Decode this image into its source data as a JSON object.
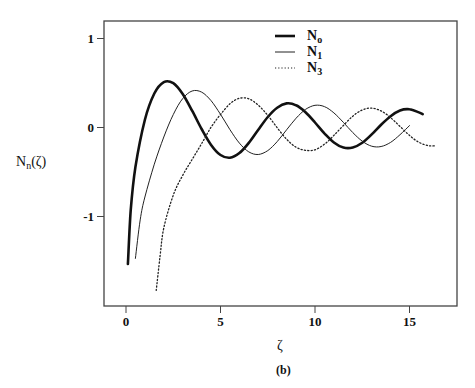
{
  "chart_data": {
    "type": "line",
    "title": "",
    "caption": "(b)",
    "xlabel": "ζ",
    "ylabel_main": "N",
    "ylabel_sub": "n",
    "ylabel_tail": "(ζ)",
    "xlim": [
      -1.2,
      17.4
    ],
    "ylim": [
      -2.0,
      1.2
    ],
    "xticks": [
      0,
      5,
      10,
      15
    ],
    "yticks": [
      1,
      0,
      -1
    ],
    "xtick_labels": [
      "0",
      "5",
      "10",
      "15"
    ],
    "ytick_labels": [
      "1",
      "0",
      "-1"
    ],
    "grid": false,
    "legend_position": "upper center",
    "series": [
      {
        "name": "N0",
        "label_main": "N",
        "label_sub": "o",
        "style": "thick",
        "x": [
          0.1,
          0.25,
          0.5,
          1,
          1.5,
          2,
          2.5,
          3,
          3.5,
          4,
          4.5,
          5,
          5.5,
          6,
          6.5,
          7,
          7.5,
          8,
          8.5,
          9,
          9.5,
          10,
          10.5,
          11,
          11.5,
          12,
          12.5,
          13,
          13.5,
          14,
          14.5,
          15,
          15.5,
          15.7
        ],
        "values": [
          -1.534,
          -0.931,
          -0.445,
          0.088,
          0.382,
          0.51,
          0.498,
          0.377,
          0.189,
          -0.017,
          -0.195,
          -0.309,
          -0.339,
          -0.288,
          -0.173,
          -0.026,
          0.118,
          0.223,
          0.271,
          0.25,
          0.171,
          0.056,
          -0.066,
          -0.169,
          -0.225,
          -0.225,
          -0.171,
          -0.078,
          0.032,
          0.127,
          0.191,
          0.205,
          0.17,
          0.15
        ]
      },
      {
        "name": "N1",
        "label_main": "N",
        "label_sub": "1",
        "style": "thin",
        "x": [
          0.5,
          0.75,
          1,
          1.5,
          2,
          2.5,
          3,
          3.5,
          4,
          4.5,
          5,
          5.5,
          6,
          6.5,
          7,
          7.5,
          8,
          8.5,
          9,
          9.5,
          10,
          10.5,
          11,
          11.5,
          12,
          12.5,
          13,
          13.5,
          14,
          14.5,
          15
        ],
        "values": [
          -1.471,
          -1.038,
          -0.781,
          -0.412,
          -0.107,
          0.146,
          0.325,
          0.41,
          0.398,
          0.301,
          0.148,
          -0.024,
          -0.175,
          -0.274,
          -0.303,
          -0.259,
          -0.158,
          -0.026,
          0.104,
          0.203,
          0.249,
          0.235,
          0.164,
          0.057,
          -0.057,
          -0.154,
          -0.21,
          -0.214,
          -0.167,
          -0.081,
          0.021
        ]
      },
      {
        "name": "N3",
        "label_main": "N",
        "label_sub": "3",
        "style": "dotted",
        "x": [
          1.6,
          1.8,
          2,
          2.5,
          3,
          3.5,
          4,
          4.5,
          5,
          5.5,
          6,
          6.5,
          7,
          7.5,
          8,
          8.5,
          9,
          9.5,
          10,
          10.5,
          11,
          11.5,
          12,
          12.5,
          13,
          13.5,
          14,
          14.5,
          15,
          15.5,
          16,
          16.4
        ],
        "values": [
          -1.83,
          -1.45,
          -1.128,
          -0.76,
          -0.538,
          -0.359,
          -0.182,
          0.003,
          0.146,
          0.266,
          0.328,
          0.322,
          0.251,
          0.136,
          -0.003,
          -0.132,
          -0.222,
          -0.256,
          -0.251,
          -0.188,
          -0.089,
          0.023,
          0.127,
          0.197,
          0.218,
          0.186,
          0.111,
          0.012,
          -0.089,
          -0.166,
          -0.204,
          -0.206
        ]
      }
    ]
  }
}
